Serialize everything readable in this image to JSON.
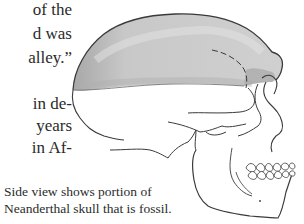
{
  "body_text": {
    "lines": [
      {
        "text": "of the",
        "top": 1
      },
      {
        "text": "d  was",
        "top": 25
      },
      {
        "text": "alley.”",
        "top": 49
      },
      {
        "text": "in de-",
        "top": 95
      },
      {
        "text": "years",
        "top": 117
      },
      {
        "text": "in Af-",
        "top": 139
      }
    ]
  },
  "figure": {
    "fossil_region_color": "#c8c8c8",
    "fossil_region_shadow": "#a9a9a9",
    "line_color": "#3a3a3a",
    "caption": {
      "line1": "Side view shows portion of",
      "line2": "Neanderthal skull that is fossil."
    }
  }
}
